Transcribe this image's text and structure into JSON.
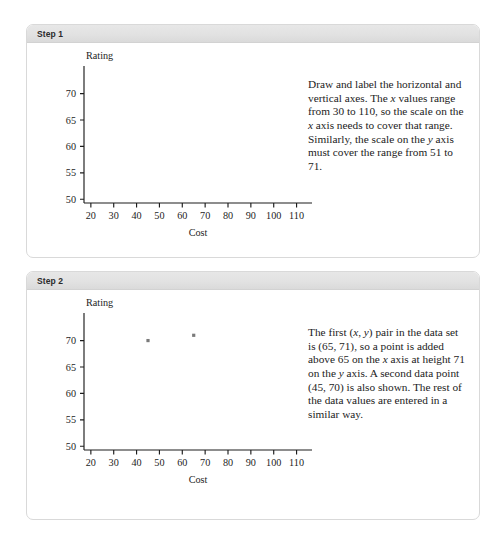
{
  "page": {
    "background": "#ffffff",
    "panel_border_color": "#d9d9d9",
    "header_bg": "#e2e2e2"
  },
  "panels": [
    {
      "id": "step-1",
      "header_label": "Step 1",
      "description": "Draw and label the horizontal and vertical axes. The x values range from 30 to 110, so the scale on the x axis needs to cover that range. Similarly, the scale on the y axis must cover the range from 51 to 71.",
      "chart_ref": 0
    },
    {
      "id": "step-2",
      "header_label": "Step 2",
      "description": "The first (x, y) pair in the data set is (65, 71), so a point is added above 65 on the x axis at height 71 on the y axis. A second data point (45, 70) is also shown. The rest of the data values are entered in a similar way.",
      "chart_ref": 1
    }
  ],
  "chart_data": [
    {
      "type": "scatter",
      "title": "",
      "xlabel": "Cost",
      "ylabel": "Rating",
      "xlim": [
        17,
        115
      ],
      "ylim": [
        49.3,
        72
      ],
      "xticks": [
        20,
        30,
        40,
        50,
        60,
        70,
        80,
        90,
        100,
        110
      ],
      "xticklabels": [
        "20",
        "30",
        "40",
        "50",
        "60",
        "70",
        "80",
        "90",
        "100",
        "110"
      ],
      "yticks": [
        50,
        55,
        60,
        65,
        70
      ],
      "yticklabels": [
        "50",
        "55",
        "60",
        "65",
        "70"
      ],
      "grid": false,
      "legend": null,
      "points": [],
      "point_color": "#7a7a7a"
    },
    {
      "type": "scatter",
      "title": "",
      "xlabel": "Cost",
      "ylabel": "Rating",
      "xlim": [
        17,
        115
      ],
      "ylim": [
        49.3,
        72
      ],
      "xticks": [
        20,
        30,
        40,
        50,
        60,
        70,
        80,
        90,
        100,
        110
      ],
      "xticklabels": [
        "20",
        "30",
        "40",
        "50",
        "60",
        "70",
        "80",
        "90",
        "100",
        "110"
      ],
      "yticks": [
        50,
        55,
        60,
        65,
        70
      ],
      "yticklabels": [
        "50",
        "55",
        "60",
        "65",
        "70"
      ],
      "grid": false,
      "legend": null,
      "points": [
        {
          "x": 45,
          "y": 70
        },
        {
          "x": 65,
          "y": 71
        }
      ],
      "point_color": "#7a7a7a"
    }
  ]
}
